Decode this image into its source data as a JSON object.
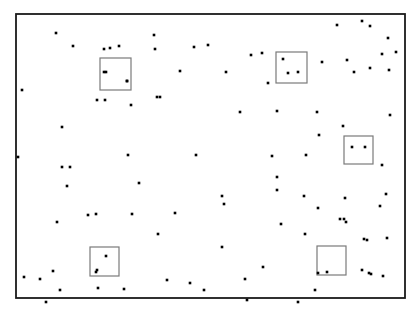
{
  "figure": {
    "title": "",
    "caption": "",
    "background_color": "#ffffff"
  },
  "frame": {
    "name": "study-plot-boundary",
    "x": 16,
    "y": 14,
    "width": 389,
    "height": 284,
    "stroke_color": "#1a1a1a",
    "stroke_width": 1.8
  },
  "chart_data": {
    "type": "scatter",
    "title": "",
    "subtitle": "",
    "xlabel": "",
    "ylabel": "",
    "xlim": [
      16,
      405
    ],
    "ylim": [
      14,
      298
    ],
    "grid": false,
    "legend": "none",
    "point_count": 120,
    "point_color": "#000000",
    "point_size": 2.6,
    "quadrat_count": 5,
    "quadrat_color": "#7a7a7a",
    "series": [
      {
        "name": "points",
        "marker": "square",
        "points": [
          [
            56,
            33
          ],
          [
            73,
            46
          ],
          [
            119,
            46
          ],
          [
            104,
            49
          ],
          [
            110,
            48
          ],
          [
            154,
            35
          ],
          [
            194,
            47
          ],
          [
            208,
            45
          ],
          [
            251,
            55
          ],
          [
            262,
            53
          ],
          [
            337,
            25
          ],
          [
            362,
            21
          ],
          [
            370,
            26
          ],
          [
            388,
            38
          ],
          [
            382,
            54
          ],
          [
            389,
            70
          ],
          [
            370,
            68
          ],
          [
            354,
            72
          ],
          [
            396,
            52
          ],
          [
            106,
            72
          ],
          [
            127,
            81
          ],
          [
            155,
            49
          ],
          [
            180,
            71
          ],
          [
            226,
            72
          ],
          [
            268,
            83
          ],
          [
            322,
            62
          ],
          [
            347,
            60
          ],
          [
            97,
            100
          ],
          [
            105,
            100
          ],
          [
            131,
            105
          ],
          [
            157,
            97
          ],
          [
            160,
            97
          ],
          [
            240,
            112
          ],
          [
            277,
            111
          ],
          [
            317,
            112
          ],
          [
            390,
            115
          ],
          [
            62,
            127
          ],
          [
            343,
            126
          ],
          [
            319,
            135
          ],
          [
            18,
            157
          ],
          [
            22,
            90
          ],
          [
            128,
            155
          ],
          [
            196,
            155
          ],
          [
            272,
            156
          ],
          [
            306,
            155
          ],
          [
            382,
            165
          ],
          [
            62,
            167
          ],
          [
            70,
            167
          ],
          [
            67,
            186
          ],
          [
            139,
            183
          ],
          [
            277,
            177
          ],
          [
            277,
            190
          ],
          [
            222,
            196
          ],
          [
            224,
            204
          ],
          [
            345,
            198
          ],
          [
            304,
            196
          ],
          [
            318,
            208
          ],
          [
            386,
            194
          ],
          [
            380,
            206
          ],
          [
            344,
            219
          ],
          [
            346,
            222
          ],
          [
            96,
            214
          ],
          [
            88,
            215
          ],
          [
            132,
            214
          ],
          [
            175,
            213
          ],
          [
            57,
            222
          ],
          [
            281,
            224
          ],
          [
            305,
            234
          ],
          [
            340,
            219
          ],
          [
            364,
            239
          ],
          [
            387,
            238
          ],
          [
            367,
            240
          ],
          [
            158,
            234
          ],
          [
            222,
            247
          ],
          [
            263,
            267
          ],
          [
            245,
            279
          ],
          [
            96,
            272
          ],
          [
            98,
            288
          ],
          [
            53,
            271
          ],
          [
            40,
            279
          ],
          [
            24,
            277
          ],
          [
            60,
            290
          ],
          [
            46,
            302
          ],
          [
            124,
            289
          ],
          [
            167,
            280
          ],
          [
            190,
            283
          ],
          [
            204,
            290
          ],
          [
            247,
            300
          ],
          [
            298,
            302
          ],
          [
            362,
            270
          ],
          [
            369,
            273
          ],
          [
            371,
            274
          ],
          [
            383,
            276
          ],
          [
            315,
            290
          ],
          [
            318,
            273
          ]
        ]
      }
    ],
    "quadrats": [
      {
        "label": "quadrat-1",
        "x": 100,
        "y": 58,
        "width": 31,
        "height": 32,
        "points_inside": [
          [
            104,
            72
          ],
          [
            127,
            81
          ]
        ]
      },
      {
        "label": "quadrat-2",
        "x": 276,
        "y": 52,
        "width": 31,
        "height": 31,
        "points_inside": [
          [
            283,
            59
          ],
          [
            288,
            73
          ],
          [
            298,
            72
          ]
        ]
      },
      {
        "label": "quadrat-3",
        "x": 344,
        "y": 136,
        "width": 29,
        "height": 28,
        "points_inside": [
          [
            352,
            147
          ],
          [
            365,
            147
          ]
        ]
      },
      {
        "label": "quadrat-4",
        "x": 90,
        "y": 247,
        "width": 29,
        "height": 29,
        "points_inside": [
          [
            106,
            256
          ],
          [
            97,
            270
          ]
        ]
      },
      {
        "label": "quadrat-5",
        "x": 317,
        "y": 246,
        "width": 29,
        "height": 29,
        "points_inside": [
          [
            327,
            272
          ]
        ]
      }
    ]
  }
}
